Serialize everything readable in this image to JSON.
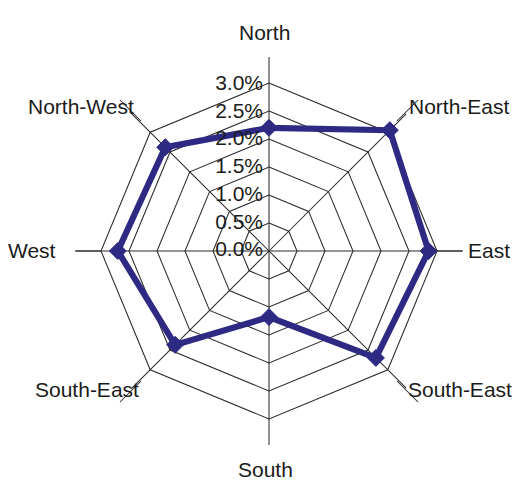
{
  "chart_data": {
    "type": "radar",
    "title": "",
    "subtitle": "",
    "xlabel": "",
    "ylabel": "",
    "categories": [
      "North",
      "North-East",
      "East",
      "South-East",
      "South",
      "South-East",
      "West",
      "North-West"
    ],
    "values": [
      2.2,
      3.05,
      2.85,
      2.7,
      1.18,
      2.37,
      2.7,
      2.62
    ],
    "series": [
      {
        "name": "",
        "values": [
          2.2,
          3.05,
          2.85,
          2.7,
          1.18,
          2.37,
          2.7,
          2.62
        ]
      }
    ],
    "tick_labels": [
      "0.0%",
      "0.5%",
      "1.0%",
      "1.5%",
      "2.0%",
      "2.5%",
      "3.0%"
    ],
    "tick_values": [
      0.0,
      0.5,
      1.0,
      1.5,
      2.0,
      2.5,
      3.0
    ],
    "rlim": [
      0.0,
      3.0
    ],
    "grid": true,
    "grid_rings": 6,
    "legend": "none",
    "start_angle_deg": 90,
    "direction": "clockwise",
    "series_color": "#2e2a84",
    "grid_color": "#2b2b2b",
    "background_color": "#ffffff"
  },
  "axis_labels": [
    {
      "text": "North",
      "name": "axis-label-north"
    },
    {
      "text": "North-East",
      "name": "axis-label-north-east"
    },
    {
      "text": "East",
      "name": "axis-label-east"
    },
    {
      "text": "South-East",
      "name": "axis-label-south-east-right"
    },
    {
      "text": "South",
      "name": "axis-label-south"
    },
    {
      "text": "South-East",
      "name": "axis-label-south-east-left"
    },
    {
      "text": "West",
      "name": "axis-label-west"
    },
    {
      "text": "North-West",
      "name": "axis-label-north-west"
    }
  ],
  "radial_ticks": [
    {
      "text": "3.0%"
    },
    {
      "text": "2.5%"
    },
    {
      "text": "2.0%"
    },
    {
      "text": "1.5%"
    },
    {
      "text": "1.0%"
    },
    {
      "text": "0.5%"
    },
    {
      "text": "0.0%"
    }
  ]
}
